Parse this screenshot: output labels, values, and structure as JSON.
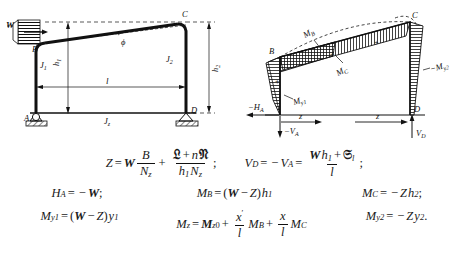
{
  "figure_left": {
    "name": "two-hinged-asymmetric-frame",
    "load_label": "W",
    "joint_labels": {
      "b": "B",
      "c": "C",
      "a": "A",
      "d": "D"
    },
    "member_inertia": {
      "left_column": "J",
      "left_column_sub": "1",
      "right_column": "J",
      "right_column_sub": "2",
      "beam": "J",
      "beam_sub": "z"
    },
    "dimensions": {
      "span": "l",
      "left_height": "h",
      "left_height_sub": "1",
      "right_height": "h",
      "right_height_sub": "2"
    },
    "beam_angle_label": "ϕ"
  },
  "figure_right": {
    "name": "bending-moment-diagram",
    "joint_labels": {
      "b": "B",
      "c": "C",
      "d": "D"
    },
    "reactions": {
      "horizontal": "−H",
      "horizontal_sub": "A",
      "vertical_left": "−V",
      "vertical_left_sub": "A",
      "vertical_right": "V",
      "vertical_right_sub": "D"
    },
    "moments": {
      "m_b": "M",
      "m_b_sub": "B",
      "m_c": "M",
      "m_c_sub": "C",
      "m_y1": "M",
      "m_y1_sub": "y1",
      "m_y2": "−M",
      "m_y2_sub": "y2"
    },
    "coordinates": {
      "z_left": "z",
      "z_right": "z"
    },
    "signs": {
      "positive": "+",
      "negative": "−"
    }
  },
  "formulas": {
    "row1": {
      "eq1": {
        "lhs": "Z",
        "eq": "=",
        "factor": "W",
        "frac1_num": "B",
        "frac1_den": "N",
        "frac1_den_sub": "z",
        "plus": "+",
        "frac2_num_l": "𝔏",
        "frac2_num_plus": "+",
        "frac2_num_n": "n",
        "frac2_num_r": "𝔑",
        "frac2_den_h": "h",
        "frac2_den_h_sub": "1",
        "frac2_den_n": "N",
        "frac2_den_n_sub": "z",
        "end": ";"
      },
      "eq2": {
        "lhs": "V",
        "lhs_sub": "D",
        "eq1": "=",
        "minus": "−",
        "mid": "V",
        "mid_sub": "A",
        "eq2": "=",
        "num_w": "W",
        "num_h": "h",
        "num_h_sub": "1",
        "num_plus": "+",
        "num_s": "𝔖",
        "num_s_sub": "l",
        "den": "l",
        "end": ";"
      }
    },
    "row2": {
      "eq1": {
        "lhs": "H",
        "lhs_sub": "A",
        "eq": "=",
        "minus": "−",
        "rhs": "W",
        "end": ";"
      },
      "eq2": {
        "lhs": "M",
        "lhs_sub": "B",
        "eq": "=",
        "open": "(",
        "w": "W",
        "minus": "−",
        "z": "Z",
        "close": ")",
        "h": "h",
        "h_sub": "1"
      },
      "eq3": {
        "lhs": "M",
        "lhs_sub": "C",
        "eq": "=",
        "minus": "−",
        "z": "Z",
        "h": "h",
        "h_sub": "2",
        "end": ";"
      }
    },
    "row3": {
      "eq1": {
        "lhs": "M",
        "lhs_sub": "y1",
        "eq": "=",
        "open": "(",
        "w": "W",
        "minus": "−",
        "z": "Z",
        "close": ")",
        "y": "y",
        "y_sub": "1"
      },
      "eq2": {
        "lhs": "M",
        "lhs_sub": "z",
        "eq": "=",
        "m0": "M",
        "m0_sub": "z",
        "m0_sup": "0",
        "plus1": "+",
        "f1_num": "x",
        "f1_num_sup": "′",
        "f1_den": "l",
        "mb": "M",
        "mb_sub": "B",
        "plus2": "+",
        "f2_num": "x",
        "f2_den": "l",
        "mc": "M",
        "mc_sub": "C"
      },
      "eq3": {
        "lhs": "M",
        "lhs_sub": "y2",
        "eq": "=",
        "minus": "−",
        "z": "Z",
        "y": "y",
        "y_sub": "2",
        "end": "."
      }
    }
  }
}
